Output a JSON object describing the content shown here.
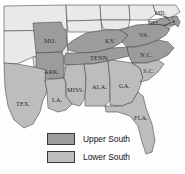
{
  "figure": {
    "type": "thematic-map",
    "width": 185,
    "height": 174
  },
  "colors": {
    "upper_south": "#9c9c9c",
    "lower_south": "#bdbdbd",
    "outside_region": "#e9e9e9",
    "background": "#fdfdfd",
    "border": "#4a4a4a",
    "label": "#16161a"
  },
  "legend": {
    "items": [
      {
        "label": "Upper South",
        "swatch": "#9c9c9c",
        "swatch_name": "upper-south-swatch"
      },
      {
        "label": "Lower South",
        "swatch": "#bdbdbd",
        "swatch_name": "lower-south-swatch"
      }
    ]
  },
  "states": [
    {
      "id": "mo",
      "label": "MO.",
      "group": "Upper South",
      "x": 44,
      "y": 38
    },
    {
      "id": "ark",
      "label": "ARK.",
      "group": "Upper South",
      "x": 44,
      "y": 69
    },
    {
      "id": "tenn",
      "label": "TENN.",
      "group": "Upper South",
      "x": 90,
      "y": 59
    },
    {
      "id": "ky",
      "label": "KY.",
      "group": "Upper South",
      "x": 105,
      "y": 41
    },
    {
      "id": "va",
      "label": "VA.",
      "group": "Upper South",
      "x": 139,
      "y": 35
    },
    {
      "id": "nc",
      "label": "N.C.",
      "group": "Upper South",
      "x": 140,
      "y": 55
    },
    {
      "id": "md",
      "label": "MD.",
      "group": "Upper South",
      "x": 157,
      "y": 15
    },
    {
      "id": "del",
      "label": "DEL.",
      "group": "Upper South",
      "x": 152,
      "y": 25
    },
    {
      "id": "sc",
      "label": "S.C.",
      "group": "Lower South",
      "x": 145,
      "y": 72
    },
    {
      "id": "ga",
      "label": "GA.",
      "group": "Lower South",
      "x": 120,
      "y": 86
    },
    {
      "id": "ala",
      "label": "ALA.",
      "group": "Lower South",
      "x": 96,
      "y": 86
    },
    {
      "id": "miss",
      "label": "MISS.",
      "group": "Lower South",
      "x": 71,
      "y": 89
    },
    {
      "id": "la",
      "label": "LA.",
      "group": "Lower South",
      "x": 53,
      "y": 100
    },
    {
      "id": "tex",
      "label": "TEX.",
      "group": "Lower South",
      "x": 16,
      "y": 104
    },
    {
      "id": "fla",
      "label": "FLA.",
      "group": "Lower South",
      "x": 136,
      "y": 118
    }
  ]
}
